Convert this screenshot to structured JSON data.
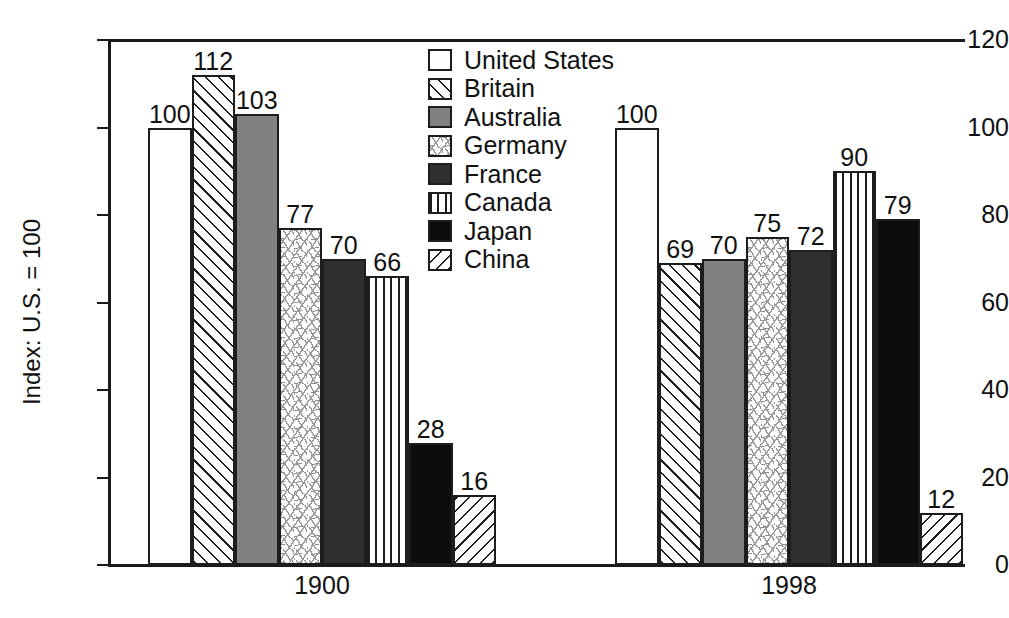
{
  "chart_data": {
    "type": "bar",
    "title": "",
    "xlabel": "",
    "ylabel": "Index: U.S. = 100",
    "categories": [
      "1900",
      "1998"
    ],
    "ylim": [
      0,
      120
    ],
    "yticks": [
      0,
      20,
      40,
      60,
      80,
      100,
      120
    ],
    "ytick_labels": [
      "0",
      "20",
      "40",
      "60",
      "80",
      "100",
      "120"
    ],
    "grid": false,
    "legend_position": "top-center",
    "value_labels": true,
    "series": [
      {
        "name": "United States",
        "pattern": "solid-light-gray",
        "color": "#d2d2d2",
        "values": [
          100,
          100
        ]
      },
      {
        "name": "Britain",
        "pattern": "diagonal-hatch-forward",
        "color": "#ffffff",
        "values": [
          112,
          69
        ]
      },
      {
        "name": "Australia",
        "pattern": "solid-medium-gray",
        "color": "#818181",
        "values": [
          103,
          70
        ]
      },
      {
        "name": "Germany",
        "pattern": "speckle",
        "color": "#ffffff",
        "values": [
          77,
          75
        ]
      },
      {
        "name": "France",
        "pattern": "solid-dark-gray",
        "color": "#2f2f2f",
        "values": [
          70,
          72
        ]
      },
      {
        "name": "Canada",
        "pattern": "vertical-lines",
        "color": "#ffffff",
        "values": [
          66,
          90
        ]
      },
      {
        "name": "Japan",
        "pattern": "solid-black",
        "color": "#0d0d0d",
        "values": [
          28,
          79
        ]
      },
      {
        "name": "China",
        "pattern": "diagonal-hatch-back",
        "color": "#ffffff",
        "values": [
          16,
          12
        ]
      }
    ]
  },
  "legend": {
    "items": [
      {
        "label": "United States"
      },
      {
        "label": "Britain"
      },
      {
        "label": "Australia"
      },
      {
        "label": "Germany"
      },
      {
        "label": "France"
      },
      {
        "label": "Canada"
      },
      {
        "label": "Japan"
      },
      {
        "label": "China"
      }
    ]
  }
}
